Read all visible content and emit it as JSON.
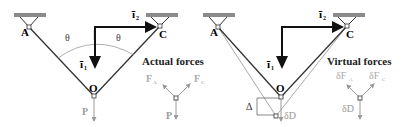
{
  "figure": {
    "left_panel": {
      "labels": {
        "A": "A",
        "C": "C",
        "O": "O",
        "theta_left": "θ",
        "theta_right": "θ",
        "i1": "ī",
        "i1_sub": "1",
        "i2": "ī",
        "i2_sub": "2",
        "P": "P"
      },
      "title": "Actual forces",
      "fbd": {
        "FA": "F",
        "FA_sub": "A",
        "FC": "F",
        "FC_sub": "C",
        "P": "P"
      }
    },
    "right_panel": {
      "labels": {
        "A": "A",
        "C": "C",
        "O": "O",
        "i1": "ī",
        "i1_sub": "1",
        "i2": "ī",
        "i2_sub": "2",
        "delta": "Δ",
        "dD": "δD"
      },
      "title": "Virtual forces",
      "fbd": {
        "dFA": "δF",
        "dFA_sub": "A",
        "dFC": "δF",
        "dFC_sub": "C",
        "dD": "δD"
      }
    },
    "colors": {
      "member": "#333333",
      "support": "#8a8a8a",
      "gray_text": "#9a9a9a",
      "arrow": "#111111"
    }
  }
}
